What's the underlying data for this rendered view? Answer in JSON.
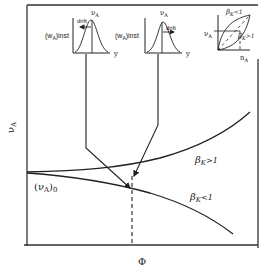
{
  "diagram": {
    "y_axis_label": "νA",
    "x_axis_label": "Φ",
    "origin_label": "(νA)0",
    "curves": [
      {
        "name": "upper",
        "label": "βK>1"
      },
      {
        "name": "lower",
        "label": "βK<1"
      }
    ],
    "insets": [
      {
        "name": "distribution-left",
        "title": "(wA)inst",
        "y_label": "νA",
        "x_label": "y",
        "annotation": "drift",
        "drift_direction": "left"
      },
      {
        "name": "distribution-right",
        "title": "(wA)inst",
        "y_label": "νA",
        "x_label": "y",
        "annotation": "drift",
        "drift_direction": "right"
      },
      {
        "name": "composition-plot",
        "y_label": "νA",
        "x_label": "nA",
        "curve_labels": [
          "βK<1",
          "βK>1"
        ]
      }
    ]
  },
  "text": {
    "nu": "ν",
    "sub_A": "A",
    "phi": "Φ",
    "w": "(w",
    "inst": ")inst",
    "y": "y",
    "drift": "drift",
    "beta": "β",
    "sub_K": "K",
    "gt1": ">1",
    "lt1": "<1",
    "n": "n",
    "origin_open": "(ν",
    "origin_close": ")",
    "origin_sub0": "0"
  }
}
